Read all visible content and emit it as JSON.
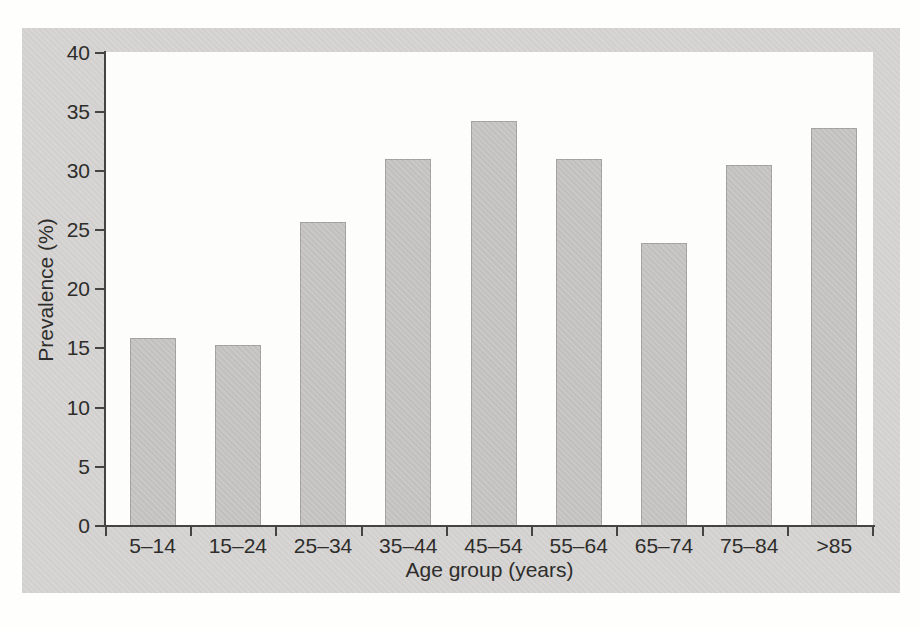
{
  "figure": {
    "panel_background": "#d5d4d2",
    "plot_background": "#fdfdfb",
    "page_background": "#fefefd"
  },
  "chart_data": {
    "type": "bar",
    "title": "",
    "categories": [
      "5–14",
      "15–24",
      "25–34",
      "35–44",
      "45–54",
      "55–64",
      "65–74",
      "75–84",
      ">85"
    ],
    "values": [
      15.9,
      15.3,
      25.7,
      31.0,
      34.2,
      31.0,
      23.9,
      30.5,
      33.6
    ],
    "xlabel": "Age group (years)",
    "ylabel": "Prevalence (%)",
    "ylim": [
      0,
      40
    ],
    "yticks": [
      0,
      5,
      10,
      15,
      20,
      25,
      30,
      35,
      40
    ],
    "grid": false,
    "legend": null,
    "bar_color": "#c6c5c3",
    "axis_color": "#454442",
    "text_color": "#2e2d2b"
  }
}
